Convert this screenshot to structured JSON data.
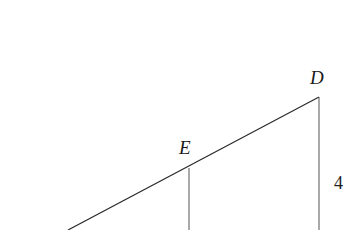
{
  "figure": {
    "type": "geometry-diagram",
    "points": {
      "D": {
        "label": "D",
        "x": 319,
        "y": 97
      },
      "E": {
        "label": "E",
        "x": 189,
        "y": 167
      }
    },
    "segments": [
      {
        "name": "hypotenuse",
        "from": [
          68,
          230
        ],
        "to": [
          319,
          97
        ]
      },
      {
        "name": "vertical-at-D",
        "from": [
          319,
          97
        ],
        "to": [
          319,
          230
        ]
      },
      {
        "name": "vertical-at-E",
        "from": [
          189,
          167
        ],
        "to": [
          189,
          230
        ]
      }
    ],
    "labels": {
      "point_D": "D",
      "point_E": "E",
      "length_D_vertical": "4"
    },
    "colors": {
      "line": "#2a2a2a",
      "text": "#1a1a1a",
      "background": "#ffffff"
    }
  }
}
